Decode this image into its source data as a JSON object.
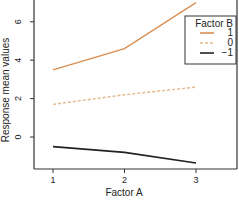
{
  "chart_data": {
    "type": "line",
    "title": "",
    "xlabel": "Factor A",
    "ylabel": "Response mean values",
    "x": [
      1,
      2,
      3
    ],
    "xticks": [
      "1",
      "2",
      "3"
    ],
    "yticks": [
      "0",
      "2",
      "4",
      "6"
    ],
    "ylim": [
      -1.7,
      7.1
    ],
    "xlim": [
      0.74,
      3.57
    ],
    "grid": false,
    "legend": {
      "title": "Factor B",
      "position": "upper right"
    },
    "series": [
      {
        "name": "1",
        "values": [
          3.5,
          4.6,
          7.0
        ],
        "color": "#d98e52",
        "style": "solid"
      },
      {
        "name": "0",
        "values": [
          1.7,
          2.2,
          2.6
        ],
        "color": "#e3b98a",
        "style": "dashed"
      },
      {
        "name": "−1",
        "values": [
          -0.5,
          -0.8,
          -1.35
        ],
        "color": "#222222",
        "style": "solid"
      }
    ]
  }
}
